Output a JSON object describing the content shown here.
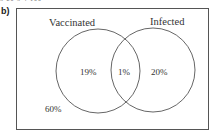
{
  "header": {
    "cut_off_text": "5      20     5     4     100",
    "part_label": "b)"
  },
  "diagram": {
    "type": "venn",
    "sets": [
      {
        "label": "Vaccinated",
        "exclusive_value": "19%"
      },
      {
        "label": "Infected",
        "exclusive_value": "20%"
      }
    ],
    "intersection_value": "1%",
    "outside_value": "60%"
  }
}
